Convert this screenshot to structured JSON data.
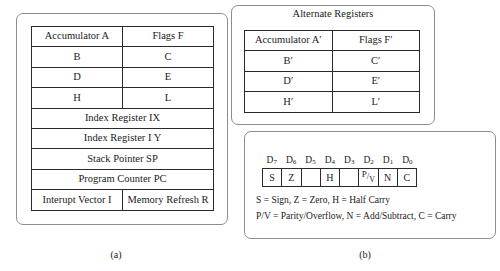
{
  "figure": {
    "panel_a": {
      "register_rows": [
        {
          "cells": [
            "Accumulator A",
            "Flags F"
          ],
          "span": 1
        },
        {
          "cells": [
            "B",
            "C"
          ],
          "span": 1
        },
        {
          "cells": [
            "D",
            "E"
          ],
          "span": 1
        },
        {
          "cells": [
            "H",
            "L"
          ],
          "span": 1
        },
        {
          "cells": [
            "Index Register IX"
          ],
          "span": 2
        },
        {
          "cells": [
            "Index Register I Y"
          ],
          "span": 2
        },
        {
          "cells": [
            "Stack Pointer SP"
          ],
          "span": 2
        },
        {
          "cells": [
            "Program Counter PC"
          ],
          "span": 2
        },
        {
          "cells": [
            "Interupt Vector I",
            "Memory Refresh R"
          ],
          "span": 1
        }
      ],
      "caption": "(a)"
    },
    "panel_b": {
      "alternate_title": "Alternate Registers",
      "register_rows": [
        {
          "cells": [
            "Accumulator A′",
            "Flags F′"
          ],
          "span": 1
        },
        {
          "cells": [
            "B′",
            "C′"
          ],
          "span": 1
        },
        {
          "cells": [
            "D′",
            "E′"
          ],
          "span": 1
        },
        {
          "cells": [
            "H′",
            "L′"
          ],
          "span": 1
        }
      ],
      "flag_register": {
        "bit_labels": [
          "D",
          "D",
          "D",
          "D",
          "D",
          "D",
          "D",
          "D"
        ],
        "bit_subscripts": [
          "7",
          "6",
          "5",
          "4",
          "3",
          "2",
          "1",
          "0"
        ],
        "flags": [
          "S",
          "Z",
          "",
          "H",
          "",
          "P/V",
          "N",
          "C"
        ],
        "pv_numerator": "P",
        "pv_slash": "/",
        "pv_denominator": "V"
      },
      "legend": [
        "S = Sign, Z = Zero, H = Half Carry",
        "P/V = Parity/Overflow, N = Add/Subtract, C = Carry"
      ],
      "caption": "(b)"
    }
  },
  "colors": {
    "panel_border": "#8d8d8d",
    "cell_border": "#2a2a2a",
    "text": "#1b1b1b",
    "background": "#ffffff"
  }
}
